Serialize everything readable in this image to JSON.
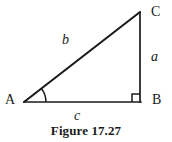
{
  "figure": {
    "caption": "Figure 17.27",
    "background_color": "#ffffff",
    "stroke_color": "#1a1a1a",
    "vertices": [
      {
        "id": "A",
        "label": "A",
        "x": 24,
        "y": 102,
        "role": "acute-angle-vertex"
      },
      {
        "id": "B",
        "label": "B",
        "x": 140,
        "y": 102,
        "role": "right-angle-vertex"
      },
      {
        "id": "C",
        "label": "C",
        "x": 140,
        "y": 12,
        "role": "apex-vertex"
      }
    ],
    "sides": [
      {
        "id": "a",
        "label": "a",
        "from": "B",
        "to": "C",
        "description": "vertical leg opposite angle A"
      },
      {
        "id": "b",
        "label": "b",
        "from": "A",
        "to": "C",
        "description": "hypotenuse"
      },
      {
        "id": "c",
        "label": "c",
        "from": "A",
        "to": "B",
        "description": "horizontal leg (base)"
      }
    ],
    "markers": {
      "right_angle": {
        "at": "B",
        "size": 8,
        "description": "square marker indicating 90 degrees"
      },
      "angle_arc": {
        "at": "A",
        "radius": 22,
        "description": "arc marking the acute angle at A"
      }
    }
  }
}
